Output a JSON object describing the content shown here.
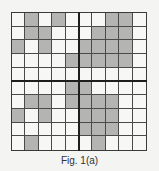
{
  "figure": {
    "caption": "Fig. 1(a)",
    "rows": 10,
    "cols": 10,
    "colors": {
      "filled": "#b4b4b2",
      "empty": "#f7f7f5",
      "gridline": "#4a4a4a",
      "axis": "#1e1e1e"
    },
    "cells": [
      [
        0,
        1,
        0,
        1,
        0,
        0,
        0,
        1,
        1,
        0
      ],
      [
        0,
        1,
        1,
        0,
        0,
        0,
        1,
        1,
        1,
        0
      ],
      [
        1,
        0,
        1,
        0,
        0,
        1,
        1,
        1,
        1,
        0
      ],
      [
        0,
        0,
        0,
        0,
        1,
        1,
        1,
        1,
        1,
        0
      ],
      [
        0,
        0,
        0,
        0,
        0,
        0,
        0,
        0,
        0,
        0
      ],
      [
        0,
        0,
        0,
        0,
        1,
        1,
        0,
        0,
        0,
        0
      ],
      [
        0,
        1,
        1,
        0,
        1,
        1,
        1,
        1,
        0,
        0
      ],
      [
        1,
        0,
        1,
        0,
        0,
        1,
        1,
        1,
        0,
        0
      ],
      [
        0,
        0,
        0,
        0,
        0,
        1,
        1,
        1,
        0,
        0
      ],
      [
        0,
        1,
        0,
        0,
        0,
        0,
        1,
        0,
        0,
        0
      ]
    ]
  }
}
